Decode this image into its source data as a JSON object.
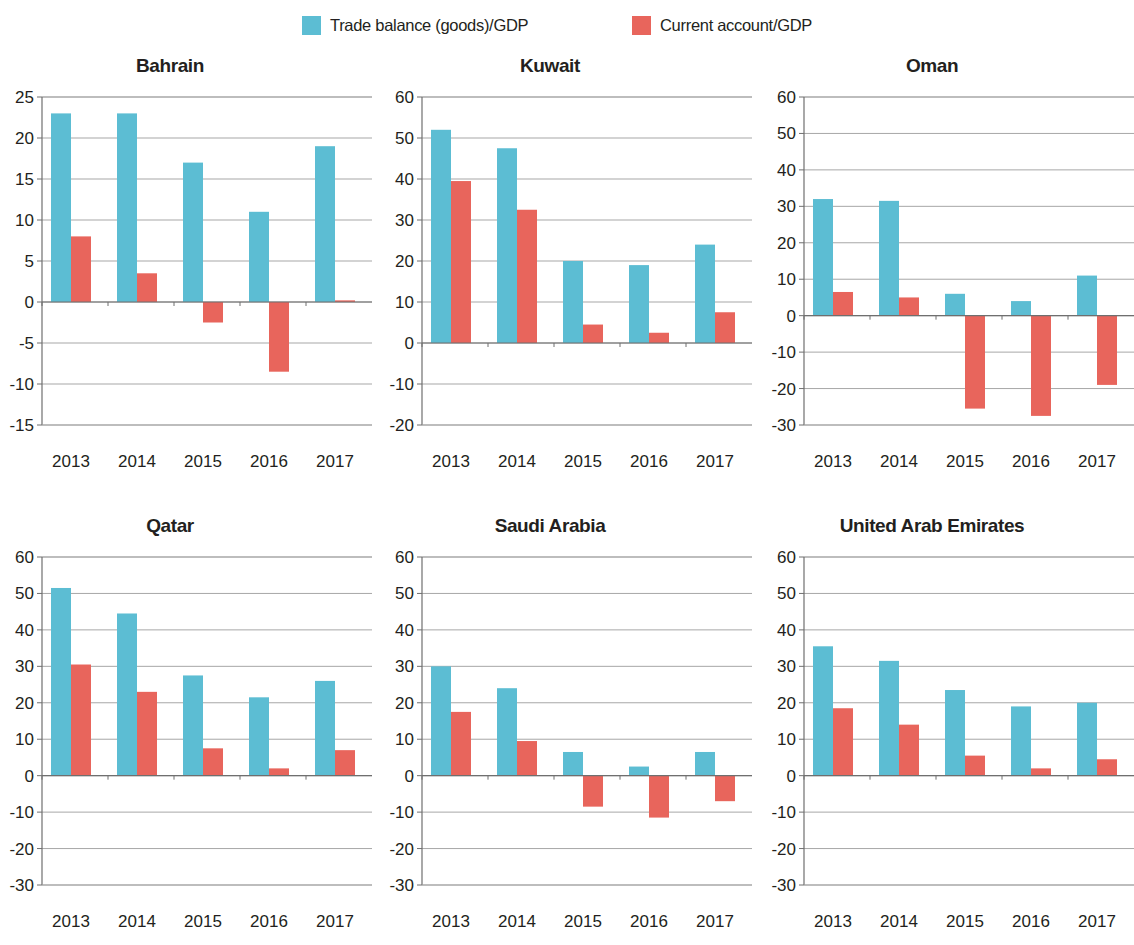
{
  "legend": {
    "entries": [
      {
        "label": "Trade balance (goods)/GDP",
        "color": "#5cbdd3",
        "icon": "legend-swatch"
      },
      {
        "label": "Current account/GDP",
        "color": "#e8655c",
        "icon": "legend-swatch"
      }
    ]
  },
  "colors": {
    "trade_balance": "#5cbdd3",
    "current_account": "#e8655c",
    "grid": "#a7a7a7",
    "axis": "#6f6f6f",
    "text": "#231f20",
    "background": "#ffffff"
  },
  "chart_data": [
    {
      "type": "bar",
      "title": "Bahrain",
      "xlabel": "",
      "ylabel": "",
      "categories": [
        "2013",
        "2014",
        "2015",
        "2016",
        "2017"
      ],
      "ylim": [
        -15,
        25
      ],
      "ytick_step": 5,
      "yticks": [
        25,
        20,
        15,
        10,
        5,
        0,
        -5,
        -10,
        -15
      ],
      "ytick_labels": [
        "25",
        "20",
        "15",
        "10",
        "5",
        "0",
        "-5",
        "-10",
        "-15"
      ],
      "grid": true,
      "legend_position": "top",
      "series": [
        {
          "name": "Trade balance (goods)/GDP",
          "color": "#5cbdd3",
          "values": [
            23,
            23,
            17,
            11,
            19
          ]
        },
        {
          "name": "Current account/GDP",
          "color": "#e8655c",
          "values": [
            8,
            3.5,
            -2.5,
            -8.5,
            0.2
          ]
        }
      ]
    },
    {
      "type": "bar",
      "title": "Kuwait",
      "xlabel": "",
      "ylabel": "",
      "categories": [
        "2013",
        "2014",
        "2015",
        "2016",
        "2017"
      ],
      "ylim": [
        -20,
        60
      ],
      "ytick_step": 10,
      "yticks": [
        60,
        50,
        40,
        30,
        20,
        10,
        0,
        -10,
        -20
      ],
      "ytick_labels": [
        "60",
        "50",
        "40",
        "30",
        "20",
        "10",
        "0",
        "-10",
        "-20"
      ],
      "grid": true,
      "legend_position": "top",
      "series": [
        {
          "name": "Trade balance (goods)/GDP",
          "color": "#5cbdd3",
          "values": [
            52,
            47.5,
            20,
            19,
            24
          ]
        },
        {
          "name": "Current account/GDP",
          "color": "#e8655c",
          "values": [
            39.5,
            32.5,
            4.5,
            2.5,
            7.5
          ]
        }
      ]
    },
    {
      "type": "bar",
      "title": "Oman",
      "xlabel": "",
      "ylabel": "",
      "categories": [
        "2013",
        "2014",
        "2015",
        "2016",
        "2017"
      ],
      "ylim": [
        -30,
        60
      ],
      "ytick_step": 10,
      "yticks": [
        60,
        50,
        40,
        30,
        20,
        10,
        0,
        -10,
        -20,
        -30
      ],
      "ytick_labels": [
        "60",
        "50",
        "40",
        "30",
        "20",
        "10",
        "0",
        "-10",
        "-20",
        "-30"
      ],
      "grid": true,
      "legend_position": "top",
      "series": [
        {
          "name": "Trade balance (goods)/GDP",
          "color": "#5cbdd3",
          "values": [
            32,
            31.5,
            6,
            4,
            11
          ]
        },
        {
          "name": "Current account/GDP",
          "color": "#e8655c",
          "values": [
            6.5,
            5,
            -25.5,
            -27.5,
            -19
          ]
        }
      ]
    },
    {
      "type": "bar",
      "title": "Qatar",
      "xlabel": "",
      "ylabel": "",
      "categories": [
        "2013",
        "2014",
        "2015",
        "2016",
        "2017"
      ],
      "ylim": [
        -30,
        60
      ],
      "ytick_step": 10,
      "yticks": [
        60,
        50,
        40,
        30,
        20,
        10,
        0,
        -10,
        -20,
        -30
      ],
      "ytick_labels": [
        "60",
        "50",
        "40",
        "30",
        "20",
        "10",
        "0",
        "-10",
        "-20",
        "-30"
      ],
      "grid": true,
      "legend_position": "top",
      "series": [
        {
          "name": "Trade balance (goods)/GDP",
          "color": "#5cbdd3",
          "values": [
            51.5,
            44.5,
            27.5,
            21.5,
            26
          ]
        },
        {
          "name": "Current account/GDP",
          "color": "#e8655c",
          "values": [
            30.5,
            23,
            7.5,
            2,
            7
          ]
        }
      ]
    },
    {
      "type": "bar",
      "title": "Saudi Arabia",
      "xlabel": "",
      "ylabel": "",
      "categories": [
        "2013",
        "2014",
        "2015",
        "2016",
        "2017"
      ],
      "ylim": [
        -30,
        60
      ],
      "ytick_step": 10,
      "yticks": [
        60,
        50,
        40,
        30,
        20,
        10,
        0,
        -10,
        -20,
        -30
      ],
      "ytick_labels": [
        "60",
        "50",
        "40",
        "30",
        "20",
        "10",
        "0",
        "-10",
        "-20",
        "-30"
      ],
      "grid": true,
      "legend_position": "top",
      "series": [
        {
          "name": "Trade balance (goods)/GDP",
          "color": "#5cbdd3",
          "values": [
            30,
            24,
            6.5,
            2.5,
            6.5
          ]
        },
        {
          "name": "Current account/GDP",
          "color": "#e8655c",
          "values": [
            17.5,
            9.5,
            -8.5,
            -11.5,
            -7
          ]
        }
      ]
    },
    {
      "type": "bar",
      "title": "United Arab Emirates",
      "xlabel": "",
      "ylabel": "",
      "categories": [
        "2013",
        "2014",
        "2015",
        "2016",
        "2017"
      ],
      "ylim": [
        -30,
        60
      ],
      "ytick_step": 10,
      "yticks": [
        60,
        50,
        40,
        30,
        20,
        10,
        0,
        -10,
        -20,
        -30
      ],
      "ytick_labels": [
        "60",
        "50",
        "40",
        "30",
        "20",
        "10",
        "0",
        "-10",
        "-20",
        "-30"
      ],
      "grid": true,
      "legend_position": "top",
      "series": [
        {
          "name": "Trade balance (goods)/GDP",
          "color": "#5cbdd3",
          "values": [
            35.5,
            31.5,
            23.5,
            19,
            20
          ]
        },
        {
          "name": "Current account/GDP",
          "color": "#e8655c",
          "values": [
            18.5,
            14,
            5.5,
            2,
            4.5
          ]
        }
      ]
    }
  ]
}
